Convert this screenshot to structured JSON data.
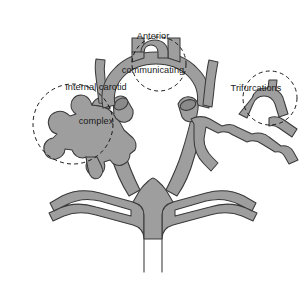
{
  "figure": {
    "background_color": "#ffffff",
    "vessel_fill_color": "#9e9e9e",
    "vessel_stroke_color": "#3a3a3a",
    "lumen_fill_color": "#8a8a8a",
    "annotation_stroke_color": "#111111",
    "annotation_style": "dashed-circle"
  },
  "labels": {
    "anterior_communicating": {
      "line1": "Anterior",
      "line2": "communicating"
    },
    "internal_carotid": {
      "line1": "Internal carotid",
      "line2": "complex"
    },
    "trifurcations": {
      "line1": "Trifurcations"
    }
  },
  "annotations": [
    {
      "name": "anterior-communicating-circle",
      "shape": "dashed-circle",
      "cx": 159,
      "cy": 64,
      "r": 27
    },
    {
      "name": "internal-carotid-circle",
      "shape": "dashed-circle",
      "cx": 73,
      "cy": 124,
      "r": 40
    },
    {
      "name": "trifurcations-circle",
      "shape": "dashed-circle",
      "cx": 270,
      "cy": 98,
      "r": 27
    }
  ],
  "vessel_regions": [
    {
      "name": "anterior-cerebral-arteries",
      "description": "paired vertical vessels joined by anterior communicating bridge"
    },
    {
      "name": "anterior-arc",
      "description": "arched anterior segment of the circle"
    },
    {
      "name": "left-internal-carotid-complex",
      "description": "multi-lobed aneurysm cluster on left carotid"
    },
    {
      "name": "right-middle-cerebral-artery",
      "description": "branching middle cerebral artery on right"
    },
    {
      "name": "right-trifurcation",
      "description": "three-way branch point on right"
    },
    {
      "name": "posterior-cerebral-arteries",
      "description": "paired posterior curving branches"
    },
    {
      "name": "basilar-artery",
      "description": "vertical trunk at the bottom"
    },
    {
      "name": "left-cut-vessel-stump",
      "description": "cut vessel showing elliptical lumen, left"
    },
    {
      "name": "right-cut-vessel-stump",
      "description": "cut vessel showing elliptical lumen, right"
    }
  ]
}
